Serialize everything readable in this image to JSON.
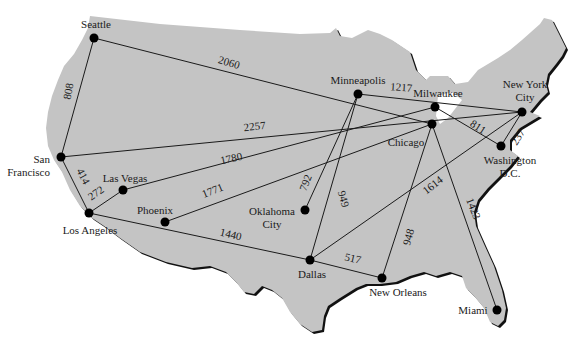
{
  "diagram": {
    "title": "",
    "map_fill": "#c4c4c4",
    "map_shadow": "#111111",
    "cities": [
      {
        "id": "seattle",
        "label": [
          "Seattle"
        ],
        "x": 94,
        "y": 38,
        "lx": 96,
        "ly": 28,
        "anchor": "middle"
      },
      {
        "id": "san-francisco",
        "label": [
          "San",
          "Francisco"
        ],
        "x": 61,
        "y": 157,
        "lx": 50,
        "ly": 163,
        "anchor": "end"
      },
      {
        "id": "las-vegas",
        "label": [
          "Las Vegas"
        ],
        "x": 123,
        "y": 190,
        "lx": 125,
        "ly": 182,
        "anchor": "middle"
      },
      {
        "id": "los-angeles",
        "label": [
          "Los Angeles"
        ],
        "x": 89,
        "y": 213,
        "lx": 90,
        "ly": 234,
        "anchor": "middle"
      },
      {
        "id": "phoenix",
        "label": [
          "Phoenix"
        ],
        "x": 165,
        "y": 222,
        "lx": 155,
        "ly": 214,
        "anchor": "middle"
      },
      {
        "id": "oklahoma-city",
        "label": [
          "Oklahoma",
          "City"
        ],
        "x": 305,
        "y": 210,
        "lx": 272,
        "ly": 215,
        "anchor": "middle"
      },
      {
        "id": "minneapolis",
        "label": [
          "Minneapolis"
        ],
        "x": 358,
        "y": 94,
        "lx": 358,
        "ly": 84,
        "anchor": "middle"
      },
      {
        "id": "milwaukee",
        "label": [
          "Milwaukee"
        ],
        "x": 435,
        "y": 107,
        "lx": 438,
        "ly": 97,
        "anchor": "middle"
      },
      {
        "id": "chicago",
        "label": [
          "Chicago"
        ],
        "x": 432,
        "y": 124,
        "lx": 406,
        "ly": 146,
        "anchor": "middle"
      },
      {
        "id": "new-york-city",
        "label": [
          "New York",
          "City"
        ],
        "x": 522,
        "y": 112,
        "lx": 525,
        "ly": 88,
        "anchor": "middle"
      },
      {
        "id": "washington-dc",
        "label": [
          "Washington",
          "D.C."
        ],
        "x": 501,
        "y": 146,
        "lx": 510,
        "ly": 164,
        "anchor": "middle"
      },
      {
        "id": "dallas",
        "label": [
          "Dallas"
        ],
        "x": 310,
        "y": 260,
        "lx": 312,
        "ly": 278,
        "anchor": "middle"
      },
      {
        "id": "new-orleans",
        "label": [
          "New Orleans"
        ],
        "x": 382,
        "y": 278,
        "lx": 398,
        "ly": 296,
        "anchor": "middle"
      },
      {
        "id": "miami",
        "label": [
          "Miami"
        ],
        "x": 497,
        "y": 310,
        "lx": 473,
        "ly": 314,
        "anchor": "middle"
      }
    ],
    "edges": [
      {
        "from": "seattle",
        "to": "san-francisco",
        "distance": "808",
        "lx": 72,
        "ly": 92,
        "rot": -80
      },
      {
        "from": "seattle",
        "to": "chicago",
        "distance": "2060",
        "lx": 228,
        "ly": 66,
        "rot": 17
      },
      {
        "from": "san-francisco",
        "to": "new-york-city",
        "distance": "2257",
        "lx": 255,
        "ly": 130,
        "rot": -6
      },
      {
        "from": "san-francisco",
        "to": "los-angeles",
        "distance": "414",
        "lx": 80,
        "ly": 178,
        "rot": 62
      },
      {
        "from": "las-vegas",
        "to": "los-angeles",
        "distance": "272",
        "lx": 98,
        "ly": 196,
        "rot": -35
      },
      {
        "from": "las-vegas",
        "to": "milwaukee",
        "distance": "1780",
        "lx": 232,
        "ly": 162,
        "rot": -12
      },
      {
        "from": "phoenix",
        "to": "chicago",
        "distance": "1771",
        "lx": 214,
        "ly": 194,
        "rot": -22
      },
      {
        "from": "los-angeles",
        "to": "dallas",
        "distance": "1440",
        "lx": 230,
        "ly": 238,
        "rot": 13
      },
      {
        "from": "minneapolis",
        "to": "oklahoma-city",
        "distance": "792",
        "lx": 309,
        "ly": 184,
        "rot": -68
      },
      {
        "from": "minneapolis",
        "to": "dallas",
        "distance": "949",
        "lx": 340,
        "ly": 200,
        "rot": 74
      },
      {
        "from": "minneapolis",
        "to": "new-york-city",
        "distance": "1217",
        "lx": 401,
        "ly": 91,
        "rot": 4
      },
      {
        "from": "milwaukee",
        "to": "washington-dc",
        "distance": "811",
        "lx": 476,
        "ly": 130,
        "rot": 33
      },
      {
        "from": "new-york-city",
        "to": "washington-dc",
        "distance": "237",
        "lx": 521,
        "ly": 139,
        "rot": -58
      },
      {
        "from": "dallas",
        "to": "new-orleans",
        "distance": "517",
        "lx": 352,
        "ly": 262,
        "rot": 13
      },
      {
        "from": "dallas",
        "to": "new-york-city",
        "distance": "1614",
        "lx": 435,
        "ly": 188,
        "rot": -38
      },
      {
        "from": "chicago",
        "to": "new-orleans",
        "distance": "948",
        "lx": 412,
        "ly": 238,
        "rot": -74
      },
      {
        "from": "chicago",
        "to": "miami",
        "distance": "1423",
        "lx": 470,
        "ly": 210,
        "rot": 68
      }
    ]
  }
}
